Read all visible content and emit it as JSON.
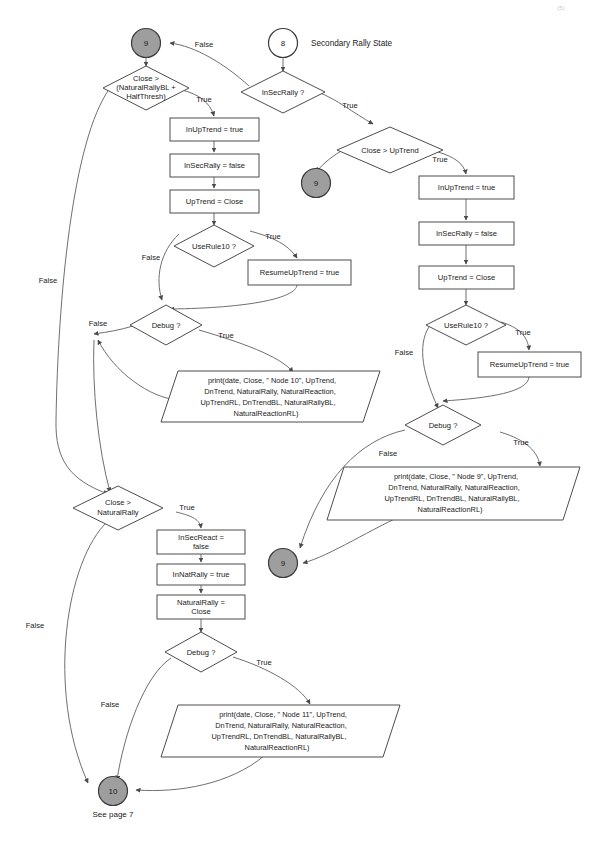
{
  "page": {
    "corner_mark": "(5)",
    "caption": "Secondary Rally State",
    "footer_note": "See page 7"
  },
  "labels": {
    "true": "True",
    "false": "False"
  },
  "nodes": {
    "entry_9_left": {
      "id": "n9L",
      "label": "9",
      "kind": "connector-filled"
    },
    "entry_8": {
      "id": "n8",
      "label": "8",
      "kind": "connector-open"
    },
    "exit_9_mid": {
      "id": "n9M",
      "label": "9",
      "kind": "connector-filled"
    },
    "exit_9_low": {
      "id": "n9B",
      "label": "9",
      "kind": "connector-filled"
    },
    "exit_10": {
      "id": "n10",
      "label": "10",
      "kind": "connector-filled"
    },
    "d_close_rallybl": {
      "id": "d1",
      "lines": [
        "Close >",
        "(NaturalRallyBL +",
        "HalfThresh)"
      ]
    },
    "d_insecrally": {
      "id": "d2",
      "lines": [
        "InSecRally ?"
      ]
    },
    "d_close_uptrend": {
      "id": "d3",
      "lines": [
        "Close > UpTrend"
      ]
    },
    "d_userule10_left": {
      "id": "d4",
      "lines": [
        "UseRule10 ?"
      ]
    },
    "d_debug_node10": {
      "id": "d5",
      "lines": [
        "Debug ?"
      ]
    },
    "d_userule10_right": {
      "id": "d6",
      "lines": [
        "UseRule10 ?"
      ]
    },
    "d_debug_node9": {
      "id": "d7",
      "lines": [
        "Debug ?"
      ]
    },
    "d_close_naturalrally": {
      "id": "d8",
      "lines": [
        "Close >",
        "NaturalRally"
      ]
    },
    "d_debug_node11": {
      "id": "d9",
      "lines": [
        "Debug ?"
      ]
    },
    "p_inuptrend_left": {
      "id": "p1",
      "lines": [
        "InUpTrend = true"
      ]
    },
    "p_insecrally_left": {
      "id": "p2",
      "lines": [
        "InSecRally = false"
      ]
    },
    "p_uptrend_left": {
      "id": "p3",
      "lines": [
        "UpTrend = Close"
      ]
    },
    "p_resume_left": {
      "id": "p4",
      "lines": [
        "ResumeUpTrend = true"
      ]
    },
    "p_inuptrend_right": {
      "id": "p5",
      "lines": [
        "InUpTrend = true"
      ]
    },
    "p_insecrally_right": {
      "id": "p6",
      "lines": [
        "InSecRally = false"
      ]
    },
    "p_uptrend_right": {
      "id": "p7",
      "lines": [
        "UpTrend = Close"
      ]
    },
    "p_resume_right": {
      "id": "p8",
      "lines": [
        "ResumeUpTrend = true"
      ]
    },
    "p_insecreact": {
      "id": "p9",
      "lines": [
        "InSecReact =",
        "false"
      ]
    },
    "p_innatrally": {
      "id": "p10",
      "lines": [
        "InNatRally = true"
      ]
    },
    "p_naturalrally": {
      "id": "p11",
      "lines": [
        "NaturalRally =",
        "Close"
      ]
    },
    "io_print_node10": {
      "id": "io1",
      "lines": [
        "print(date, Close, \" Node 10\", UpTrend,",
        "DnTrend, NaturalRally, NaturalReaction,",
        "UpTrendRL, DnTrendBL, NaturalRallyBL,",
        "NaturalReactionRL)"
      ]
    },
    "io_print_node9": {
      "id": "io2",
      "lines": [
        "print(date, Close, \" Node 9\", UpTrend,",
        "DnTrend, NaturalRally, NaturalReaction,",
        "UpTrendRL, DnTrendBL, NaturalRallyBL,",
        "NaturalReactionRL)"
      ]
    },
    "io_print_node11": {
      "id": "io3",
      "lines": [
        "print(date, Close, \" Node 11\", UpTrend,",
        "DnTrend, NaturalRally, NaturalReaction,",
        "UpTrendRL, DnTrendBL, NaturalRallyBL,",
        "NaturalReactionRL)"
      ]
    }
  },
  "edge_labels": {
    "e1_false": "False",
    "e2_true": "True",
    "e3_true": "True",
    "e4_true": "True",
    "e5_true": "True",
    "e5_false": "False",
    "e6_true": "True",
    "e6_false": "False",
    "e7_true": "True",
    "e7_false": "False",
    "e8_true": "True",
    "e8_false": "False",
    "e9_true": "True",
    "e9_false": "False",
    "e10_false": "False",
    "e11_false": "False",
    "e12_false": "False"
  },
  "colors": {
    "terminal_fill": "#9e9e9e",
    "line": "#6f6f6f",
    "node_stroke": "#4d4d4d",
    "text": "#1a1a1a",
    "background": "#ffffff"
  }
}
